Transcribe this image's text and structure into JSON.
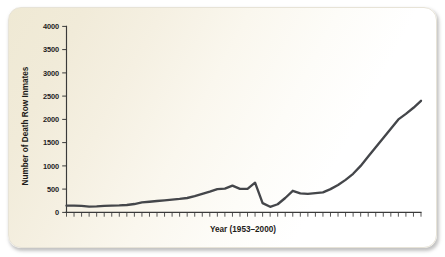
{
  "chart_data": {
    "type": "line",
    "title": "",
    "xlabel": "Year (1953–2000)",
    "ylabel": "Number of Death Row Inmates",
    "xlim": [
      1953,
      2000
    ],
    "ylim": [
      0,
      4000
    ],
    "grid": false,
    "legend": null,
    "line_color": "#44464a",
    "y_ticks": [
      0,
      500,
      1000,
      1500,
      2000,
      2500,
      3000,
      3500,
      4000
    ],
    "y_tick_labels": [
      "0",
      "500",
      "1000",
      "1500",
      "2000",
      "2500",
      "3000",
      "3500",
      "4000"
    ],
    "x_tick_count": 48,
    "x": [
      1953,
      1954,
      1955,
      1956,
      1957,
      1958,
      1959,
      1960,
      1961,
      1962,
      1963,
      1964,
      1965,
      1966,
      1967,
      1968,
      1969,
      1970,
      1971,
      1972,
      1973,
      1974,
      1975,
      1976,
      1977,
      1978,
      1979,
      1980,
      1981,
      1982,
      1983,
      1984,
      1985,
      1986,
      1987,
      1988,
      1989,
      1990,
      1991,
      1992,
      1993,
      1994,
      1995,
      1996,
      1997,
      1998,
      1999,
      2000
    ],
    "values": [
      145,
      147,
      140,
      125,
      128,
      140,
      145,
      150,
      160,
      180,
      215,
      230,
      245,
      260,
      275,
      290,
      310,
      350,
      400,
      445,
      500,
      510,
      575,
      505,
      505,
      640,
      200,
      120,
      175,
      310,
      465,
      410,
      400,
      415,
      430,
      500,
      590,
      700,
      830,
      1000,
      1200,
      1400,
      1600,
      1800,
      2000,
      2120,
      2250,
      2400
    ],
    "series_name": "Death row inmates",
    "annotations": []
  },
  "figure": {
    "card_background_start": "#efe9d4",
    "card_background_end": "#ffffff"
  }
}
